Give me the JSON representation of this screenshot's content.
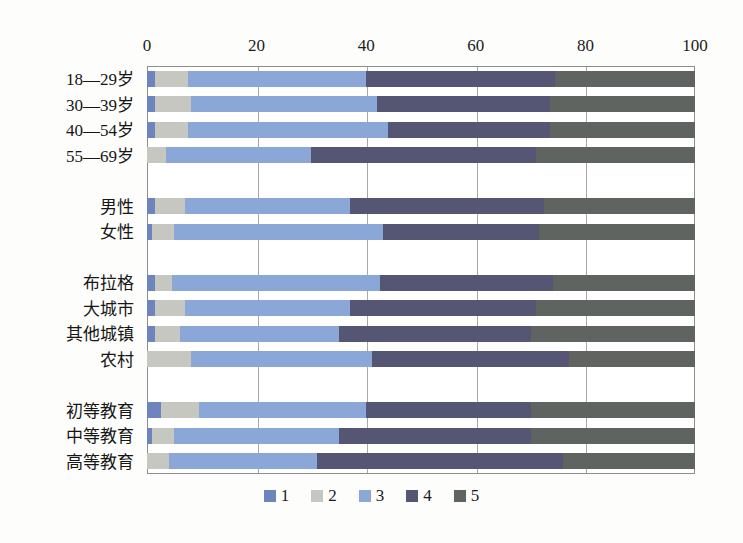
{
  "chart_data": {
    "type": "bar",
    "orientation": "horizontal",
    "stacked": true,
    "stacked_percent": true,
    "title": "",
    "subtitle": "",
    "xlabel": "",
    "ylabel": "",
    "xlim": [
      0,
      100
    ],
    "ylim": [],
    "grid": true,
    "grid_axis": "x",
    "legend_position": "bottom",
    "xticks": [
      "0",
      "20",
      "40",
      "60",
      "80",
      "100"
    ],
    "xtick_values": [
      0,
      20,
      40,
      60,
      80,
      100
    ],
    "categories": [
      "18—29岁",
      "30—39岁",
      "40—54岁",
      "55—69岁",
      "",
      "男性",
      "女性",
      "",
      "布拉格",
      "大城市",
      "其他城镇",
      "农村",
      "",
      "初等教育",
      "中等教育",
      "高等教育"
    ],
    "series": [
      {
        "name": "1",
        "color": "#6d84bd",
        "values": [
          1.5,
          1.5,
          1.5,
          0.0,
          null,
          1.5,
          1.0,
          null,
          1.5,
          1.5,
          1.5,
          0.0,
          null,
          2.5,
          1.0,
          0.0
        ]
      },
      {
        "name": "2",
        "color": "#c7c7c2",
        "values": [
          6.0,
          6.5,
          6.0,
          3.5,
          null,
          5.5,
          4.0,
          null,
          3.0,
          5.5,
          4.5,
          8.0,
          null,
          7.0,
          4.0,
          4.0
        ]
      },
      {
        "name": "3",
        "color": "#8ba7d8",
        "values": [
          32.5,
          34.0,
          36.5,
          26.5,
          null,
          30.0,
          38.0,
          null,
          38.0,
          30.0,
          29.0,
          33.0,
          null,
          30.5,
          30.0,
          27.0
        ]
      },
      {
        "name": "4",
        "color": "#555574",
        "values": [
          34.5,
          31.5,
          29.5,
          41.0,
          null,
          35.5,
          28.5,
          null,
          31.5,
          34.0,
          35.0,
          36.0,
          null,
          30.0,
          35.0,
          45.0
        ]
      },
      {
        "name": "5",
        "color": "#5f6461",
        "values": [
          25.5,
          26.5,
          26.5,
          29.0,
          null,
          27.5,
          28.5,
          null,
          26.0,
          29.0,
          30.0,
          23.0,
          null,
          30.0,
          30.0,
          24.0
        ]
      }
    ],
    "legend_entries": [
      {
        "label": "1",
        "color": "#6d84bd"
      },
      {
        "label": "2",
        "color": "#c7c7c2"
      },
      {
        "label": "3",
        "color": "#8ba7d8"
      },
      {
        "label": "4",
        "color": "#555574"
      },
      {
        "label": "5",
        "color": "#5f6461"
      }
    ],
    "group_separators_after": [
      3,
      6,
      11
    ]
  },
  "colors": {
    "series_1": "#6d84bd",
    "series_2": "#c7c7c2",
    "series_3": "#8ba7d8",
    "series_4": "#555574",
    "series_5": "#5f6461",
    "axis": "#8d8d8d",
    "grid": "#a9a9a9",
    "background": "#fdfdfb",
    "text": "#161616"
  }
}
